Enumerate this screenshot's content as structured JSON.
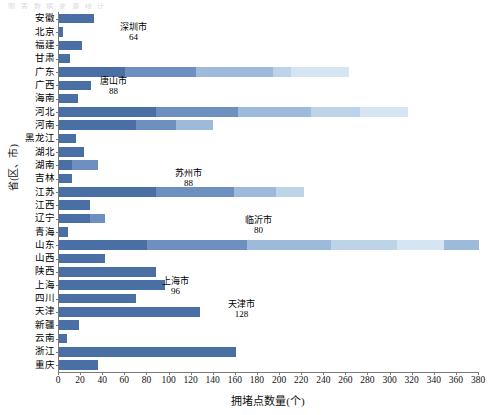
{
  "top_note": "图 表 数 据 来 源 统 计",
  "axes": {
    "y_title": "省(区、市)",
    "x_title": "拥堵点数量(个)",
    "x_ticks": [
      0,
      20,
      40,
      60,
      80,
      100,
      120,
      140,
      160,
      180,
      200,
      220,
      240,
      260,
      280,
      300,
      320,
      340,
      360,
      380
    ],
    "xlim": [
      0,
      380
    ]
  },
  "colors": {
    "dark": "#4a6fa5",
    "mid": "#6e90c0",
    "light": "#9dbada",
    "lighter": "#bcd3e8",
    "pale": "#d6e5f3",
    "axis": "#7a7a7a"
  },
  "chart_data": {
    "type": "bar",
    "orientation": "horizontal",
    "title": "",
    "xlabel": "拥堵点数量(个)",
    "ylabel": "省(区、市)",
    "xlim": [
      0,
      380
    ],
    "grid": false,
    "legend": "none",
    "categories": [
      "安徽",
      "北京",
      "福建",
      "甘肃",
      "广东",
      "广西",
      "海南",
      "河北",
      "河南",
      "黑龙江",
      "湖北",
      "湖南",
      "吉林",
      "江苏",
      "江西",
      "辽宁",
      "青海",
      "山东",
      "山西",
      "陕西",
      "上海",
      "四川",
      "天津",
      "新疆",
      "云南",
      "浙江",
      "重庆"
    ],
    "values": [
      32,
      4,
      21,
      10,
      262,
      29,
      17,
      316,
      139,
      15,
      23,
      35,
      12,
      222,
      28,
      42,
      8,
      380,
      42,
      88,
      96,
      70,
      128,
      18,
      7,
      160,
      35
    ],
    "segments": [
      [
        32
      ],
      [
        4
      ],
      [
        21
      ],
      [
        10
      ],
      [
        60,
        64,
        70,
        16,
        52
      ],
      [
        29
      ],
      [
        17
      ],
      [
        88,
        74,
        66,
        44,
        44
      ],
      [
        70,
        36,
        33
      ],
      [
        15
      ],
      [
        23
      ],
      [
        12,
        23
      ],
      [
        12
      ],
      [
        88,
        70,
        38,
        26
      ],
      [
        28
      ],
      [
        28,
        14
      ],
      [
        8
      ],
      [
        80,
        90,
        76,
        60,
        42,
        32
      ],
      [
        42
      ],
      [
        88
      ],
      [
        96
      ],
      [
        70
      ],
      [
        128
      ],
      [
        18
      ],
      [
        7
      ],
      [
        160
      ],
      [
        35
      ]
    ],
    "annotations": [
      {
        "label": "深圳市",
        "value": "64",
        "series": "广东"
      },
      {
        "label": "唐山市",
        "value": "88",
        "series": "河北"
      },
      {
        "label": "苏州市",
        "value": "88",
        "series": "江苏"
      },
      {
        "label": "临沂市",
        "value": "80",
        "series": "山东"
      },
      {
        "label": "上海市",
        "value": "96",
        "series": "上海"
      },
      {
        "label": "天津市",
        "value": "128",
        "series": "天津"
      }
    ]
  },
  "annotation_positions": [
    {
      "left": 120,
      "top": 22
    },
    {
      "left": 100,
      "top": 76
    },
    {
      "left": 175,
      "top": 168
    },
    {
      "left": 245,
      "top": 215
    },
    {
      "left": 162,
      "top": 276
    },
    {
      "left": 228,
      "top": 299
    }
  ]
}
